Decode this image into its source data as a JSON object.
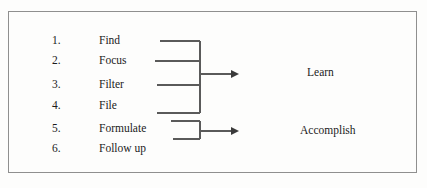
{
  "diagram": {
    "frame": {
      "border_color": "#8f8f8f",
      "background": "#fdfdfc"
    },
    "steps": [
      {
        "number": "1.",
        "label": "Find"
      },
      {
        "number": "2.",
        "label": "Focus"
      },
      {
        "number": "3.",
        "label": "Filter"
      },
      {
        "number": "4.",
        "label": "File"
      },
      {
        "number": "5.",
        "label": "Formulate"
      },
      {
        "number": "6.",
        "label": "Follow up"
      }
    ],
    "groups": [
      {
        "label": "Learn",
        "steps": [
          "1.",
          "2.",
          "3.",
          "4."
        ]
      },
      {
        "label": "Accomplish",
        "steps": [
          "5.",
          "6."
        ]
      }
    ],
    "line_color": "#5a5a5a",
    "text_color": "#1b1b1b"
  }
}
